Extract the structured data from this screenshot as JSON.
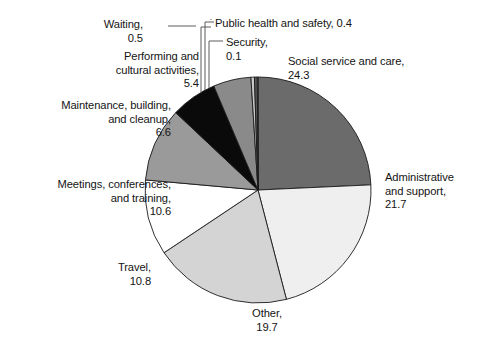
{
  "chart_data": {
    "type": "pie",
    "title": "",
    "subtitle": "",
    "units": "percent",
    "total": 100.1,
    "legend_position": "none",
    "labels_outside": true,
    "grid": false,
    "categories": [
      "Social service and care",
      "Administrative and support",
      "Other",
      "Travel",
      "Meetings, conferences, and training",
      "Maintenance, building, and cleanup",
      "Performing and cultural activities",
      "Waiting",
      "Public health and safety",
      "Security"
    ],
    "values": [
      24.3,
      21.7,
      19.7,
      10.8,
      10.6,
      6.6,
      5.4,
      0.5,
      0.4,
      0.1
    ],
    "colors": [
      "#6b6b6b",
      "#efefef",
      "#d4d4d4",
      "#ffffff",
      "#9a9a9a",
      "#0a0a0a",
      "#8a8a8a",
      "#c9c9c9",
      "#5c5c5c",
      "#e3e3e3"
    ],
    "start_angle_deg": 0,
    "direction": "clockwise",
    "slices": [
      {
        "name": "Social service and care",
        "value": 24.3,
        "label": "Social service and care,\n24.3",
        "color": "#6b6b6b"
      },
      {
        "name": "Administrative and support",
        "value": 21.7,
        "label": "Administrative\nand support,\n21.7",
        "color": "#efefef"
      },
      {
        "name": "Other",
        "value": 19.7,
        "label": "Other,\n19.7",
        "color": "#d4d4d4"
      },
      {
        "name": "Travel",
        "value": 10.8,
        "label": "Travel,\n10.8",
        "color": "#ffffff"
      },
      {
        "name": "Meetings, conferences, and training",
        "value": 10.6,
        "label": "Meetings, conferences,\nand training,\n10.6",
        "color": "#9a9a9a"
      },
      {
        "name": "Maintenance, building, and cleanup",
        "value": 6.6,
        "label": "Maintenance, building,\nand cleanup,\n6.6",
        "color": "#0a0a0a"
      },
      {
        "name": "Performing and cultural activities",
        "value": 5.4,
        "label": "Performing and\ncultural activities,\n5.4",
        "color": "#8a8a8a"
      },
      {
        "name": "Waiting",
        "value": 0.5,
        "label": "Waiting,\n0.5",
        "color": "#c9c9c9"
      },
      {
        "name": "Public health and safety",
        "value": 0.4,
        "label": "Public health and safety, 0.4",
        "color": "#5c5c5c"
      },
      {
        "name": "Security",
        "value": 0.1,
        "label": "Security,\n0.1",
        "color": "#e3e3e3"
      }
    ],
    "geometry": {
      "cx": 258,
      "cy": 190,
      "r": 113,
      "stroke": "#1a1a1a",
      "stroke_width": 0.9
    }
  },
  "labels": {
    "social": "Social service and care,\n24.3",
    "admin": "Administrative\nand support,\n21.7",
    "other": "Other,\n19.7",
    "travel": "Travel,\n10.8",
    "meetings": "Meetings, conferences,\nand training,\n10.6",
    "maintenance": "Maintenance, building,\nand cleanup,\n6.6",
    "performing": "Performing and\ncultural activities,\n5.4",
    "waiting": "Waiting,\n0.5",
    "public": "Public health and safety, 0.4",
    "security": "Security,\n0.1"
  }
}
